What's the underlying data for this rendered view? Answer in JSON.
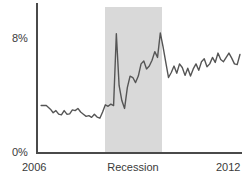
{
  "chart_data": {
    "type": "line",
    "title": "",
    "xlabel": "",
    "ylabel": "",
    "xlim": [
      2006,
      2012
    ],
    "ylim": [
      0,
      9.2
    ],
    "grid": false,
    "legend": "none",
    "y_ticks": [
      "0%",
      "8%"
    ],
    "y_tick_values": [
      0,
      8
    ],
    "x_ticks": [
      "2006",
      "2012"
    ],
    "x_tick_values": [
      2006,
      2012
    ],
    "annotations": [
      {
        "label": "Recession",
        "type": "shaded-band",
        "x_start": 2008.0,
        "x_end": 2009.5,
        "color": "#d9d9d9"
      }
    ],
    "series": [
      {
        "name": "rate",
        "color": "#555555",
        "x": [
          2006.15,
          2006.3,
          2006.42,
          2006.5,
          2006.58,
          2006.66,
          2006.74,
          2006.82,
          2006.9,
          2006.98,
          2007.06,
          2007.14,
          2007.22,
          2007.3,
          2007.38,
          2007.46,
          2007.54,
          2007.62,
          2007.7,
          2007.78,
          2007.86,
          2007.94,
          2008.02,
          2008.1,
          2008.18,
          2008.26,
          2008.34,
          2008.42,
          2008.5,
          2008.58,
          2008.66,
          2008.74,
          2008.82,
          2008.9,
          2008.98,
          2009.06,
          2009.14,
          2009.22,
          2009.3,
          2009.38,
          2009.46,
          2009.54,
          2009.62,
          2009.7,
          2009.78,
          2009.86,
          2009.94,
          2010.02,
          2010.1,
          2010.18,
          2010.26,
          2010.34,
          2010.42,
          2010.5,
          2010.58,
          2010.66,
          2010.74,
          2010.82,
          2010.9,
          2010.98,
          2011.06,
          2011.14,
          2011.22,
          2011.3,
          2011.38,
          2011.46,
          2011.54,
          2011.62,
          2011.7,
          2011.78,
          2011.86,
          2011.94
        ],
        "y": [
          3.3,
          3.3,
          3.05,
          2.8,
          2.95,
          2.7,
          2.65,
          2.95,
          2.7,
          2.72,
          3.0,
          2.95,
          3.1,
          2.85,
          2.7,
          2.55,
          2.6,
          2.48,
          2.7,
          2.5,
          2.42,
          2.85,
          3.35,
          3.25,
          3.4,
          3.3,
          8.3,
          4.7,
          3.65,
          3.1,
          4.55,
          5.35,
          5.25,
          4.9,
          5.35,
          6.2,
          6.4,
          5.85,
          6.05,
          6.45,
          7.05,
          6.65,
          8.35,
          7.4,
          6.3,
          5.25,
          5.6,
          6.05,
          5.55,
          6.2,
          5.95,
          5.4,
          5.9,
          5.35,
          5.85,
          6.2,
          5.75,
          6.35,
          6.55,
          6.0,
          6.2,
          6.65,
          6.3,
          6.95,
          6.5,
          6.35,
          6.65,
          6.95,
          6.6,
          6.2,
          6.15,
          6.85
        ]
      }
    ]
  },
  "axes": {
    "y_label_top": "8%",
    "y_label_bottom": "0%",
    "x_label_left": "2006",
    "x_label_right": "2012"
  },
  "band": {
    "label": "Recession"
  },
  "colors": {
    "line": "#555555",
    "band": "#d9d9d9",
    "axis": "#4a4a4a",
    "text": "#3a3a3a",
    "background": "#ffffff"
  }
}
